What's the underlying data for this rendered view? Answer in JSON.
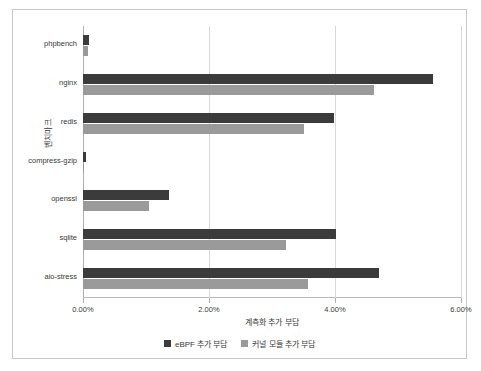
{
  "chart_data": {
    "type": "bar",
    "orientation": "horizontal",
    "title": "",
    "xlabel": "계측화 추가 부담",
    "ylabel": "벤치마크",
    "xlim": [
      0,
      6
    ],
    "xticks": [
      "0.00%",
      "2.00%",
      "4.00%",
      "6.00%"
    ],
    "xtickvalues": [
      0,
      2,
      4,
      6
    ],
    "grid": true,
    "legend_position": "bottom",
    "categories": [
      "phpbench",
      "nginx",
      "redis",
      "compress-gzip",
      "openssl",
      "sqlite",
      "aio-stress"
    ],
    "series": [
      {
        "name": "eBPF 추가 부담",
        "color": "#3b3b3b",
        "values": [
          0.1,
          5.55,
          3.98,
          0.04,
          1.37,
          4.02,
          4.7
        ]
      },
      {
        "name": "커널 모듈 추가 부담",
        "color": "#9a9a9a",
        "values": [
          0.08,
          4.62,
          3.5,
          0.02,
          1.05,
          3.22,
          3.57
        ]
      }
    ]
  },
  "legend": {
    "items": [
      {
        "label": "eBPF 추가 부담",
        "color": "#3b3b3b"
      },
      {
        "label": "커널 모듈 추가 부담",
        "color": "#9a9a9a"
      }
    ]
  }
}
